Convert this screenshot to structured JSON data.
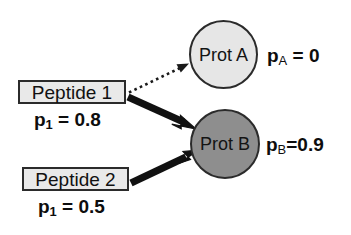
{
  "diagram": {
    "type": "peptide-protein-inference-graph",
    "background_color": "#ffffff",
    "peptides": [
      {
        "id": "peptide-1",
        "label": "Peptide 1",
        "probability_text": "p1 = 0.8",
        "probability_symbol": "p",
        "probability_subscript": "1",
        "probability_value": "0.8",
        "box_fill": "#e9e9e9",
        "box_border": "#2b2b2b"
      },
      {
        "id": "peptide-2",
        "label": "Peptide 2",
        "probability_text": "p1 = 0.5",
        "probability_symbol": "p",
        "probability_subscript": "1",
        "probability_value": "0.5",
        "box_fill": "#e9e9e9",
        "box_border": "#2b2b2b"
      }
    ],
    "proteins": [
      {
        "id": "prot-a",
        "label": "Prot A",
        "probability_symbol": "p",
        "probability_subscript": "A",
        "probability_separator": " = ",
        "probability_value": "0",
        "probability_text": "pA = 0",
        "fill": "#e6e6e6",
        "border": "#2b2b2b"
      },
      {
        "id": "prot-b",
        "label": "Prot B",
        "probability_symbol": "p",
        "probability_subscript": "B",
        "probability_separator": "=",
        "probability_value": "0.9",
        "probability_text": "pB=0.9",
        "fill": "#8e8e8e",
        "border": "#2b2b2b"
      }
    ],
    "edges": [
      {
        "id": "edge-peptide1-prota",
        "from": "peptide-1",
        "to": "prot-a",
        "style": "dotted",
        "weight": "thin",
        "color": "#1a1a1a"
      },
      {
        "id": "edge-peptide1-protb",
        "from": "peptide-1",
        "to": "prot-b",
        "style": "solid",
        "weight": "thick",
        "color": "#111111"
      },
      {
        "id": "edge-peptide2-protb",
        "from": "peptide-2",
        "to": "prot-b",
        "style": "solid",
        "weight": "thick",
        "color": "#111111"
      }
    ]
  }
}
